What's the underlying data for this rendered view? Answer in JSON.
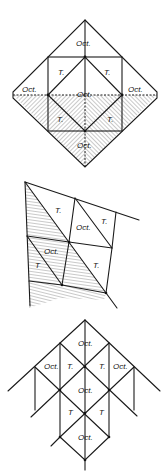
{
  "figures": [
    {
      "id": "top",
      "description": "Octahedron diamond with inscribed square; lower half hatched",
      "labels": [
        {
          "text": "Oct.",
          "x": 76,
          "y": 46
        },
        {
          "text": "T.",
          "x": 58,
          "y": 75
        },
        {
          "text": "T.",
          "x": 104,
          "y": 75
        },
        {
          "text": "Oct.",
          "x": 20,
          "y": 92
        },
        {
          "text": "Oct.",
          "x": 77,
          "y": 97
        },
        {
          "text": "Oct.",
          "x": 125,
          "y": 92
        },
        {
          "text": "T.",
          "x": 58,
          "y": 122
        },
        {
          "text": "T.",
          "x": 107,
          "y": 122
        },
        {
          "text": "Oct.",
          "x": 77,
          "y": 148
        }
      ]
    },
    {
      "id": "middle",
      "description": "Skewed layer of octahedra and tetrahedra, partially hatched",
      "labels": [
        {
          "text": "T.",
          "x": 56,
          "y": 213
        },
        {
          "text": "Oct.",
          "x": 77,
          "y": 230
        },
        {
          "text": "T.",
          "x": 101,
          "y": 224
        },
        {
          "text": "Oct.",
          "x": 45,
          "y": 254
        },
        {
          "text": "T",
          "x": 36,
          "y": 268
        },
        {
          "text": "T.",
          "x": 94,
          "y": 268
        }
      ]
    },
    {
      "id": "bottom",
      "description": "Stacked octahedra and tetrahedra lattice",
      "labels": [
        {
          "text": "Oct.",
          "x": 78,
          "y": 346
        },
        {
          "text": "Oct.",
          "x": 44,
          "y": 369
        },
        {
          "text": "T.",
          "x": 67,
          "y": 369
        },
        {
          "text": "T.",
          "x": 99,
          "y": 369
        },
        {
          "text": "Oct.",
          "x": 113,
          "y": 369
        },
        {
          "text": "Oct.",
          "x": 78,
          "y": 393
        },
        {
          "text": "T",
          "x": 68,
          "y": 415
        },
        {
          "text": "T",
          "x": 99,
          "y": 415
        },
        {
          "text": "Oct.",
          "x": 78,
          "y": 440
        }
      ]
    }
  ],
  "text": {
    "t1": "Oct.",
    "t2": "T.",
    "t3": "T.",
    "t4": "Oct.",
    "t5": "Oct.",
    "t6": "Oct.",
    "t7": "T.",
    "t8": "T.",
    "t9": "Oct.",
    "m1": "T.",
    "m2": "Oct.",
    "m3": "T.",
    "m4": "Oct.",
    "m5": "T",
    "m6": "T.",
    "b1": "Oct.",
    "b2": "Oct.",
    "b3": "T.",
    "b4": "T.",
    "b5": "Oct.",
    "b6": "Oct.",
    "b7": "T",
    "b8": "T",
    "b9": "Oct."
  },
  "colors": {
    "line": "#1a1a1a",
    "background": "#ffffff"
  }
}
